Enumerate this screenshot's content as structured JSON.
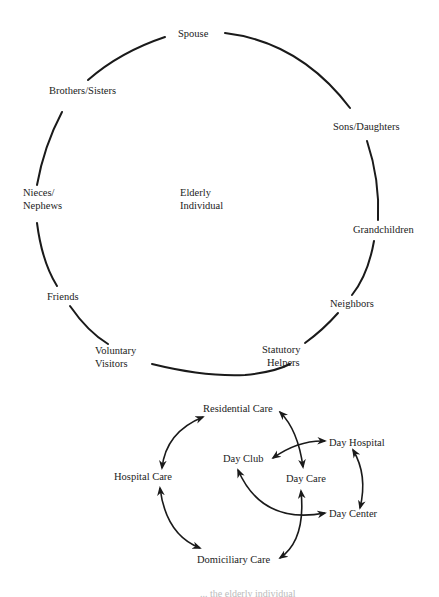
{
  "support_circle": {
    "center_label_line1": "Elderly",
    "center_label_line2": "Individual",
    "nodes": [
      {
        "id": "spouse",
        "label": "Spouse"
      },
      {
        "id": "sons_daughters",
        "label": "Sons/Daughters"
      },
      {
        "id": "grandchildren",
        "label": "Grandchildren"
      },
      {
        "id": "neighbors",
        "label": "Neighbors"
      },
      {
        "id": "statutory_helpers",
        "line1": "Statutory",
        "line2": "Helpers"
      },
      {
        "id": "voluntary_visitors",
        "line1": "Voluntary",
        "line2": "Visitors"
      },
      {
        "id": "friends",
        "label": "Friends"
      },
      {
        "id": "nieces_nephews",
        "line1": "Nieces/",
        "line2": "Nephews"
      },
      {
        "id": "brothers_sisters",
        "label": "Brothers/Sisters"
      }
    ]
  },
  "care_network": {
    "nodes": [
      {
        "id": "residential_care",
        "label": "Residential Care"
      },
      {
        "id": "day_hospital",
        "label": "Day Hospital"
      },
      {
        "id": "day_club",
        "label": "Day Club"
      },
      {
        "id": "hospital_care",
        "label": "Hospital Care"
      },
      {
        "id": "day_care",
        "label": "Day Care"
      },
      {
        "id": "day_center",
        "label": "Day Center"
      },
      {
        "id": "domiciliary_care",
        "label": "Domiciliary Care"
      }
    ],
    "links": [
      {
        "from": "Hospital Care",
        "to": "Residential Care",
        "type": "bidirectional"
      },
      {
        "from": "Residential Care",
        "to": "Day Care",
        "type": "bidirectional"
      },
      {
        "from": "Day Club",
        "to": "Day Hospital",
        "type": "bidirectional"
      },
      {
        "from": "Day Hospital",
        "to": "Day Center",
        "type": "bidirectional"
      },
      {
        "from": "Day Club",
        "to": "Day Center",
        "type": "bidirectional"
      },
      {
        "from": "Day Care",
        "to": "Domiciliary Care",
        "type": "bidirectional"
      },
      {
        "from": "Hospital Care",
        "to": "Domiciliary Care",
        "type": "bidirectional"
      }
    ]
  },
  "caption": "... the elderly individual"
}
